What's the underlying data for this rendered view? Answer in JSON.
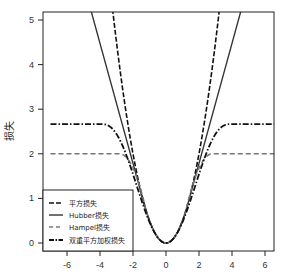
{
  "chart_data": {
    "type": "line",
    "title": "",
    "xlabel": "",
    "ylabel": "损失",
    "xlim": [
      -6.5,
      6.5
    ],
    "ylim": [
      -0.2,
      5.2
    ],
    "xticks": [
      -6,
      -4,
      -2,
      0,
      2,
      4,
      6
    ],
    "yticks": [
      0,
      1,
      2,
      3,
      4,
      5
    ],
    "grid": false,
    "legend_position": "lower left",
    "series": [
      {
        "name": "平方损失",
        "style": "dashed",
        "color": "#111111",
        "formula": "x^2/2",
        "x": [
          -3.2,
          -3,
          -2,
          -1,
          0,
          1,
          2,
          3,
          3.2
        ],
        "values": [
          5.12,
          4.5,
          2.0,
          0.5,
          0,
          0.5,
          2.0,
          4.5,
          5.12
        ]
      },
      {
        "name": "Hubber损失",
        "style": "solid",
        "color": "#333333",
        "formula": "huber k=1.345",
        "x": [
          -6,
          -4,
          -2,
          -1.345,
          0,
          1.345,
          2,
          4,
          6
        ],
        "values": [
          7.16,
          4.47,
          1.79,
          0.9,
          0,
          0.9,
          1.79,
          4.47,
          7.16
        ]
      },
      {
        "name": "Hampel损失",
        "style": "dashed",
        "color": "#777777",
        "formula": "hampel plateau 2",
        "x": [
          -6.5,
          -3,
          -2,
          0,
          2,
          3,
          6.5
        ],
        "values": [
          2,
          2,
          1.8,
          0,
          1.8,
          2,
          2
        ]
      },
      {
        "name": "双重平方加权损失",
        "style": "dashdot",
        "color": "#111111",
        "formula": "tukey biweight c=4",
        "x": [
          -6.5,
          -4,
          -2,
          0,
          2,
          4,
          6.5
        ],
        "values": [
          2.67,
          2.67,
          1.5,
          0,
          1.5,
          2.67,
          2.67
        ]
      }
    ]
  },
  "axes": {
    "ylabel": "损失",
    "xtick_labels": [
      "-6",
      "-4",
      "-2",
      "0",
      "2",
      "4",
      "6"
    ],
    "ytick_labels": [
      "0",
      "1",
      "2",
      "3",
      "4",
      "5"
    ]
  },
  "legend": {
    "items": [
      {
        "label": "平方损失"
      },
      {
        "label": "Hubber损失"
      },
      {
        "label": "Hampel损失"
      },
      {
        "label": "双重平方加权损失"
      }
    ]
  }
}
